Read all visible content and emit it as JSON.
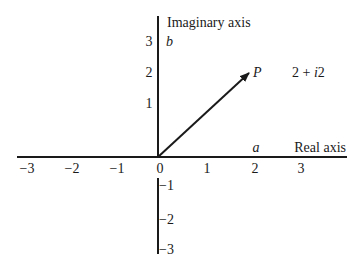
{
  "diagram": {
    "type": "complex-plane",
    "imaginary_axis_title": "Imaginary axis",
    "real_axis_title": "Real axis",
    "imag_var": "b",
    "real_var": "a",
    "point_label": "P",
    "point_expression_parts": [
      "2 + ",
      "i",
      "2"
    ],
    "real_ticks": [
      "−3",
      "−2",
      "−1",
      "0",
      "1",
      "2",
      "3"
    ],
    "imag_ticks_positive": [
      "1",
      "2",
      "3"
    ],
    "imag_ticks_negative": [
      "−1",
      "−2",
      "−3"
    ],
    "vector": {
      "from": [
        0,
        0
      ],
      "to": [
        2,
        2
      ]
    },
    "colors": {
      "ink": "#1a1a1a",
      "background": "#ffffff"
    }
  }
}
